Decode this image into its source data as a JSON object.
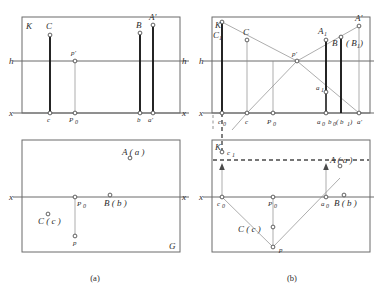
{
  "figure": {
    "captions": [
      {
        "id": "cap-a",
        "text": "(a)"
      },
      {
        "id": "cap-b",
        "text": "(b)"
      }
    ]
  },
  "panel_a": {
    "top": {
      "plane_label": "K",
      "horizon_label_left": "h",
      "horizon_label_right": "h",
      "ground_label_left": "x",
      "ground_label_right": "x",
      "points": [
        {
          "name": "C",
          "label": "C"
        },
        {
          "name": "p-prime",
          "label": "p'"
        },
        {
          "name": "B",
          "label": "B"
        },
        {
          "name": "A-prime",
          "label": "A'"
        },
        {
          "name": "c",
          "label": "c"
        },
        {
          "name": "P0",
          "label": "P",
          "sub": "0"
        },
        {
          "name": "b",
          "label": "b"
        },
        {
          "name": "a-prime",
          "label": "a'"
        }
      ]
    },
    "bottom": {
      "ground_label_left": "x",
      "ground_label_right": "x",
      "plan_label": "G",
      "points": [
        {
          "name": "A-a",
          "label": "A ( a )"
        },
        {
          "name": "P0",
          "label": "P",
          "sub": "0"
        },
        {
          "name": "B-b",
          "label": "B ( b )"
        },
        {
          "name": "C-c",
          "label": "C ( c )"
        },
        {
          "name": "p",
          "label": "p"
        }
      ]
    }
  },
  "panel_b": {
    "top": {
      "plane_label": "K",
      "horizon_label_left": "h",
      "ground_label_left": "x",
      "points": [
        {
          "name": "C1",
          "label": "C",
          "sub": "1"
        },
        {
          "name": "C",
          "label": "C"
        },
        {
          "name": "p-prime",
          "label": "p'"
        },
        {
          "name": "A1",
          "label": "A",
          "sub": "1"
        },
        {
          "name": "B",
          "label": "B"
        },
        {
          "name": "B1",
          "label": "( B",
          "sub": "1",
          "label_close": " )"
        },
        {
          "name": "A-prime",
          "label": "A'"
        },
        {
          "name": "a1",
          "label": "a",
          "sub": "1"
        },
        {
          "name": "c0",
          "label": "c",
          "sub": "0"
        },
        {
          "name": "c",
          "label": "c"
        },
        {
          "name": "P0",
          "label": "P",
          "sub": "0"
        },
        {
          "name": "a0",
          "label": "a",
          "sub": "0"
        },
        {
          "name": "b0b1",
          "label": "b",
          "sub": "0",
          "label2": "( b",
          "sub2": "1",
          "label2_close": " )"
        },
        {
          "name": "a-prime-axis",
          "label": "a'"
        }
      ]
    },
    "bottom": {
      "plane_label": "K",
      "ground_label_left": "x",
      "points": [
        {
          "name": "c1",
          "label": "c",
          "sub": "1"
        },
        {
          "name": "A-a",
          "label": "A ( a )"
        },
        {
          "name": "c0",
          "label": "c",
          "sub": "0"
        },
        {
          "name": "P0",
          "label": "P",
          "sub": "0"
        },
        {
          "name": "a0",
          "label": "a",
          "sub": "0"
        },
        {
          "name": "B-b",
          "label": "B ( b )"
        },
        {
          "name": "C-c",
          "label": "C ( c )"
        },
        {
          "name": "p",
          "label": "p"
        }
      ]
    }
  },
  "colors": {
    "frame": "#6b6b6b",
    "thin_line": "#8a8a8a",
    "thick_line": "#1a1a1a",
    "dashed": "#4a4a4a",
    "text": "#2b2b2b",
    "background": "#ffffff"
  }
}
